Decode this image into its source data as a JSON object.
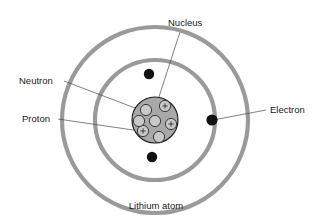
{
  "figure": {
    "caption": "Lithium atom",
    "labels": {
      "nucleus": "Nucleus",
      "neutron": "Neutron",
      "proton": "Proton",
      "electron": "Electron"
    }
  },
  "colors": {
    "background": "#ffffff",
    "orbit_ring": "#9a9a9a",
    "electron": "#111111",
    "nucleus_fill": "#a8a8a8",
    "nucleon_fill": "#c9c9c9",
    "outline": "#1a1a1a",
    "leader_line": "#4a4a4a",
    "text": "#1a1a1a"
  },
  "chart_data": {
    "type": "diagram",
    "title": "Lithium atom",
    "element": "Lithium",
    "atomic_number": 3,
    "center": {
      "x": 155,
      "y": 120
    },
    "shells": [
      {
        "name": "inner shell",
        "radius": 60,
        "electron_count": 2
      },
      {
        "name": "outer shell",
        "radius": 93,
        "electron_count": 1
      }
    ],
    "electrons": [
      {
        "id": "e1",
        "shell": "inner shell",
        "x": 149,
        "y": 74,
        "r": 5.2
      },
      {
        "id": "e2",
        "shell": "inner shell",
        "x": 152,
        "y": 157,
        "r": 5.2
      },
      {
        "id": "e3",
        "shell": "outer shell",
        "x": 212,
        "y": 120,
        "r": 5.6
      }
    ],
    "nucleus": {
      "x": 155,
      "y": 120,
      "radius": 23,
      "proton_count": 3,
      "neutron_count": 4,
      "proton_symbol": "+",
      "nucleons": [
        {
          "type": "proton",
          "x": 165,
          "y": 106,
          "r": 5.6
        },
        {
          "type": "proton",
          "x": 171,
          "y": 124,
          "r": 5.6
        },
        {
          "type": "proton",
          "x": 143,
          "y": 131,
          "r": 5.6
        },
        {
          "type": "neutron",
          "x": 146,
          "y": 110,
          "r": 5.6
        },
        {
          "type": "neutron",
          "x": 155,
          "y": 121,
          "r": 5.6
        },
        {
          "type": "neutron",
          "x": 139,
          "y": 121,
          "r": 5.6
        },
        {
          "type": "neutron",
          "x": 159,
          "y": 137,
          "r": 5.6
        }
      ]
    },
    "annotations": [
      {
        "label": "Nucleus",
        "text_x": 168,
        "text_y": 26,
        "anchor": "start",
        "leader": [
          [
            180,
            32
          ],
          [
            156,
            106
          ]
        ]
      },
      {
        "label": "Neutron",
        "text_x": 19,
        "text_y": 84,
        "anchor": "start",
        "leader": [
          [
            64,
            81
          ],
          [
            143,
            111
          ]
        ]
      },
      {
        "label": "Proton",
        "text_x": 22,
        "text_y": 122,
        "anchor": "start",
        "leader": [
          [
            58,
            119
          ],
          [
            140,
            131
          ]
        ]
      },
      {
        "label": "Electron",
        "text_x": 270,
        "text_y": 113,
        "anchor": "start",
        "leader": [
          [
            266,
            110
          ],
          [
            213,
            120
          ]
        ]
      }
    ],
    "caption_position": {
      "x": 156,
      "y": 209,
      "anchor": "middle"
    }
  }
}
